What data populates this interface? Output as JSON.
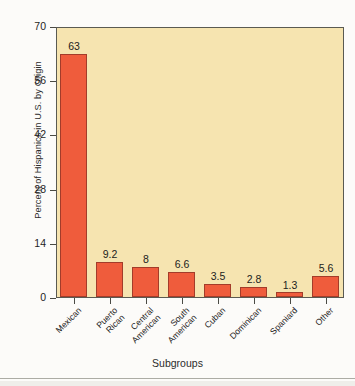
{
  "chart_data": {
    "type": "bar",
    "title": "",
    "xlabel": "Subgroups",
    "ylabel": "Percent of Hispanics in U.S. by Origin",
    "categories": [
      "Mexican",
      "Puerto Rican",
      "Central American",
      "South American",
      "Cuban",
      "Dominican",
      "Spaniard",
      "Other"
    ],
    "category_lines": [
      [
        "Mexican"
      ],
      [
        "Puerto",
        "Rican"
      ],
      [
        "Central",
        "American"
      ],
      [
        "South",
        "American"
      ],
      [
        "Cuban"
      ],
      [
        "Dominican"
      ],
      [
        "Spaniard"
      ],
      [
        "Other"
      ]
    ],
    "values": [
      63,
      9.2,
      8,
      6.6,
      3.5,
      2.8,
      1.3,
      5.6
    ],
    "value_labels": [
      "63",
      "9.2",
      "8",
      "6.6",
      "3.5",
      "2.8",
      "1.3",
      "5.6"
    ],
    "ylim": [
      0,
      70
    ],
    "yticks": [
      0,
      14,
      28,
      42,
      56,
      70
    ],
    "ytick_labels": [
      "0",
      "14",
      "28",
      "42",
      "56",
      "70"
    ],
    "grid": false,
    "legend": false,
    "colors": {
      "bar_fill": "#ef5c3c",
      "bar_border": "#a33c2a",
      "plot_background": "#f6e4b0",
      "frame": "#5a5a52",
      "page_background": "#fcfbf9",
      "text": "#1c1c1c"
    }
  }
}
